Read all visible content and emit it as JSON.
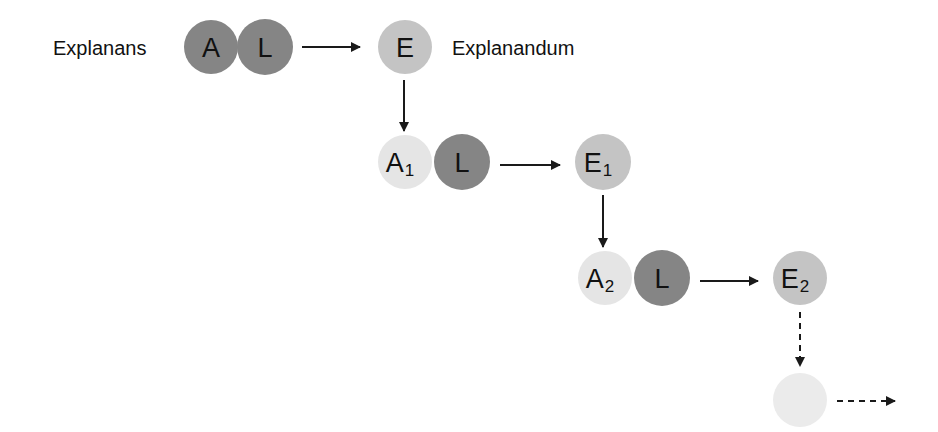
{
  "diagram": {
    "labels": {
      "explanans": "Explanans",
      "explanandum": "Explanandum"
    },
    "colors": {
      "dark": "#858585",
      "medium": "#c4c4c4",
      "light": "#e5e5e5",
      "faint": "#ebebeb",
      "arrow": "#1a1a1a"
    },
    "nodes": [
      {
        "id": "A",
        "letter": "A",
        "sub": "",
        "shade": "dark",
        "cx": 211,
        "cy": 47
      },
      {
        "id": "L0",
        "letter": "L",
        "sub": "",
        "shade": "dark",
        "cx": 265,
        "cy": 47
      },
      {
        "id": "E",
        "letter": "E",
        "sub": "",
        "shade": "medium",
        "cx": 405,
        "cy": 47
      },
      {
        "id": "A1",
        "letter": "A",
        "sub": "1",
        "shade": "light",
        "cx": 405,
        "cy": 162
      },
      {
        "id": "L1",
        "letter": "L",
        "sub": "",
        "shade": "dark",
        "cx": 462,
        "cy": 162
      },
      {
        "id": "E1",
        "letter": "E",
        "sub": "1",
        "shade": "medium",
        "cx": 603,
        "cy": 162
      },
      {
        "id": "A2",
        "letter": "A",
        "sub": "2",
        "shade": "light",
        "cx": 605,
        "cy": 278
      },
      {
        "id": "L2",
        "letter": "L",
        "sub": "",
        "shade": "dark",
        "cx": 662,
        "cy": 278
      },
      {
        "id": "E2",
        "letter": "E",
        "sub": "2",
        "shade": "medium",
        "cx": 800,
        "cy": 278
      },
      {
        "id": "E3",
        "letter": "",
        "sub": "",
        "shade": "faint",
        "cx": 800,
        "cy": 400
      }
    ],
    "edges": [
      {
        "from": "L0",
        "to": "E",
        "style": "solid"
      },
      {
        "from": "E",
        "to": "A1",
        "style": "solid"
      },
      {
        "from": "L1",
        "to": "E1",
        "style": "solid"
      },
      {
        "from": "E1",
        "to": "A2",
        "style": "solid"
      },
      {
        "from": "L2",
        "to": "E2",
        "style": "solid"
      },
      {
        "from": "E2",
        "to": "E3",
        "style": "dashed"
      },
      {
        "from": "E3",
        "to": "continuation",
        "style": "dashed"
      }
    ]
  }
}
